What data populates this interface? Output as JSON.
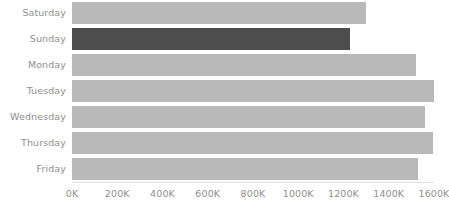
{
  "chart_data": {
    "type": "bar",
    "orientation": "horizontal",
    "title": "",
    "xlabel": "",
    "ylabel": "",
    "categories": [
      "Saturday",
      "Sunday",
      "Monday",
      "Tuesday",
      "Wednesday",
      "Thursday",
      "Friday"
    ],
    "values": [
      1300000,
      1230000,
      1520000,
      1600000,
      1560000,
      1595000,
      1530000
    ],
    "xlim": [
      0,
      1600000
    ],
    "xticks": [
      0,
      200000,
      400000,
      600000,
      800000,
      1000000,
      1200000,
      1400000,
      1600000
    ],
    "xticklabels": [
      "0K",
      "200K",
      "400K",
      "600K",
      "800K",
      "1000K",
      "1200K",
      "1400K",
      "1600K"
    ],
    "grid": false,
    "legend": null,
    "bar_colors": [
      "#b9b9b9",
      "#4d4d4d",
      "#b9b9b9",
      "#b9b9b9",
      "#b9b9b9",
      "#b9b9b9",
      "#b9b9b9"
    ],
    "highlighted_category": "Sunday",
    "colors": {
      "bar_default": "#b9b9b9",
      "bar_highlight": "#4d4d4d",
      "axis_line": "#dedede",
      "tick_text": "#8f8f8f",
      "background": "#ffffff"
    }
  }
}
